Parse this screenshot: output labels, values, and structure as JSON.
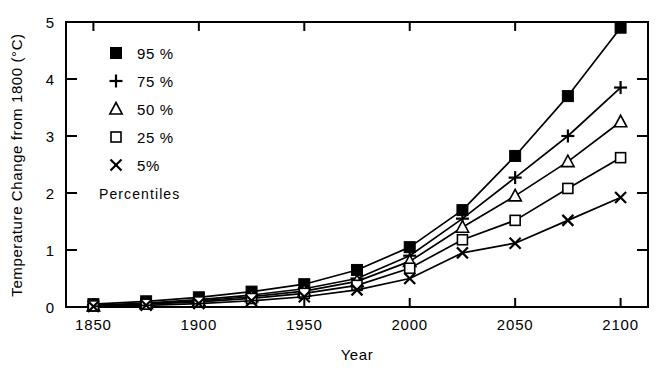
{
  "chart_data": {
    "type": "line",
    "title": "",
    "xlabel": "Year",
    "ylabel": "Temperature Change from 1800 (°C)",
    "xlim": [
      1837,
      2113
    ],
    "ylim": [
      0,
      5
    ],
    "xticks": [
      1850,
      1900,
      1950,
      2000,
      2050,
      2100
    ],
    "xticklabels": [
      "1850",
      "1900",
      "1950",
      "2000",
      "2050",
      "2100"
    ],
    "yticks": [
      0,
      1,
      2,
      3,
      4,
      5
    ],
    "yticklabels": [
      "0",
      "1",
      "2",
      "3",
      "4",
      "5"
    ],
    "grid": false,
    "legend_position": "upper-left",
    "legend_note": "Percentiles",
    "x": [
      1850,
      1875,
      1900,
      1925,
      1950,
      1975,
      2000,
      2025,
      2050,
      2075,
      2100
    ],
    "series": [
      {
        "name": "95 %",
        "marker": "filled-square",
        "values": [
          0.05,
          0.1,
          0.17,
          0.27,
          0.4,
          0.65,
          1.05,
          1.7,
          2.65,
          3.7,
          4.9
        ]
      },
      {
        "name": "75 %",
        "marker": "plus",
        "values": [
          0.03,
          0.07,
          0.13,
          0.21,
          0.32,
          0.5,
          0.9,
          1.55,
          2.27,
          3.0,
          3.85
        ]
      },
      {
        "name": "50 %",
        "marker": "open-triangle",
        "values": [
          0.02,
          0.06,
          0.11,
          0.18,
          0.28,
          0.45,
          0.8,
          1.4,
          1.95,
          2.55,
          3.25
        ]
      },
      {
        "name": "25 %",
        "marker": "open-square",
        "values": [
          0.02,
          0.05,
          0.09,
          0.15,
          0.24,
          0.38,
          0.68,
          1.18,
          1.52,
          2.08,
          2.62
        ]
      },
      {
        "name": "5%",
        "marker": "cross",
        "values": [
          0.01,
          0.03,
          0.06,
          0.11,
          0.18,
          0.3,
          0.5,
          0.95,
          1.12,
          1.52,
          1.92
        ]
      }
    ],
    "legend": [
      {
        "label": "95 %",
        "marker": "filled-square"
      },
      {
        "label": "75 %",
        "marker": "plus"
      },
      {
        "label": "50 %",
        "marker": "open-triangle"
      },
      {
        "label": "25 %",
        "marker": "open-square"
      },
      {
        "label": "5%",
        "marker": "cross"
      }
    ],
    "colors": {
      "line": "#000000",
      "marker": "#000000",
      "axis": "#000000",
      "background": "#ffffff"
    }
  }
}
